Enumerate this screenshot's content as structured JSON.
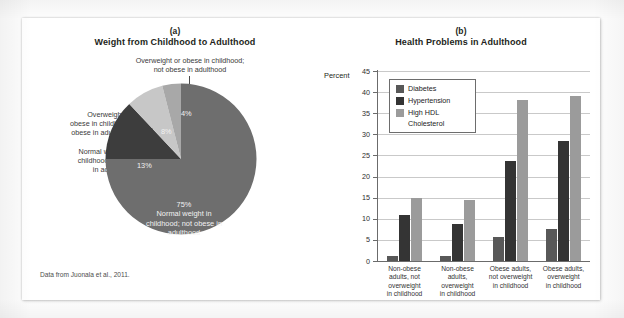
{
  "figure": {
    "credit": "Data from Juonala et al., 2011."
  },
  "chart_data": [
    {
      "type": "pie",
      "panel": "(a)",
      "title": "Weight from Childhood to Adulthood",
      "categories": [
        "Normal weight in childhood; not obese in adulthood",
        "Normal weight in childhood; obese in adulthood",
        "Overweight or obese in childhood; obese in adulthood",
        "Overweight or obese in childhood; not obese in adulthood"
      ],
      "values": [
        75,
        13,
        8,
        4
      ],
      "value_labels": [
        "75%",
        "13%",
        "8%",
        "4%"
      ],
      "colors": [
        "#6e6e6e",
        "#3d3d3d",
        "#c7c7c7",
        "#a8a8a8"
      ],
      "callouts": {
        "top": "Overweight or obese in childhood;\nnot obese in adulthood",
        "top_line1": "Overweight or obese in childhood;",
        "top_line2": "not obese in adulthood",
        "left1_line1": "Overweight or",
        "left1_line2": "obese in childhood;",
        "left1_line3": "obese in adulthood",
        "left2_line1": "Normal weight in",
        "left2_line2": "childhood; obese",
        "left2_line3": "in adulthood",
        "center_line1": "75%",
        "center_line2": "Normal weight in",
        "center_line3": "childhood; not obese in",
        "center_line4": "adulthood"
      },
      "legend": ""
    },
    {
      "type": "bar",
      "panel": "(b)",
      "title": "Health Problems in Adulthood",
      "ylabel": "Percent",
      "xlabel": "",
      "ylim": [
        0,
        45
      ],
      "yticks": [
        45,
        40,
        35,
        30,
        25,
        20,
        15,
        10,
        5,
        0
      ],
      "ytick_labels": [
        "45",
        "40",
        "35",
        "30",
        "25",
        "20",
        "15",
        "10",
        "5",
        "0"
      ],
      "grid": true,
      "legend_position": "top-left",
      "categories": [
        "Non-obese adults, not overweight in childhood",
        "Non-obese adults, overweight in childhood",
        "Obese adults, not overweight in childhood",
        "Obese adults, overweight in childhood"
      ],
      "category_lines": [
        [
          "Non-obese",
          "adults, not",
          "overweight",
          "in childhood"
        ],
        [
          "Non-obese",
          "adults,",
          "overweight",
          "in childhood"
        ],
        [
          "Obese adults,",
          "not overweight",
          "in childhood"
        ],
        [
          "Obese adults,",
          "overweight",
          "in childhood"
        ]
      ],
      "series": [
        {
          "name": "Diabetes",
          "color": "#585858",
          "values": [
            1.2,
            1.2,
            5.7,
            7.5
          ]
        },
        {
          "name": "Hypertension",
          "color": "#343434",
          "values": [
            11.0,
            8.8,
            23.7,
            28.5
          ]
        },
        {
          "name": "High HDL Cholesterol",
          "color": "#9b9b9b",
          "values": [
            15.0,
            14.5,
            38.1,
            39.2
          ]
        }
      ],
      "legend_entries": [
        {
          "label": "Diabetes",
          "color": "#585858"
        },
        {
          "label": "Hypertension",
          "color": "#343434"
        },
        {
          "label": "High HDL",
          "color": "#9b9b9b"
        },
        {
          "label": "Cholesterol",
          "color": ""
        }
      ]
    }
  ]
}
